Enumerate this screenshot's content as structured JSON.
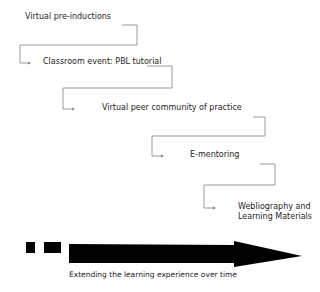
{
  "diagram": {
    "steps": [
      {
        "label": "Virtual pre-inductions"
      },
      {
        "label": "Classroom event: PBL tutorial"
      },
      {
        "label": "Virtual peer community of practice"
      },
      {
        "label": "E-mentoring"
      },
      {
        "label_line1": "Webliography and",
        "label_line2": "Learning Materials"
      }
    ],
    "timeline": {
      "caption": "Extending the learning experience over time",
      "color": "#000000"
    },
    "connector_color": "#777777"
  }
}
